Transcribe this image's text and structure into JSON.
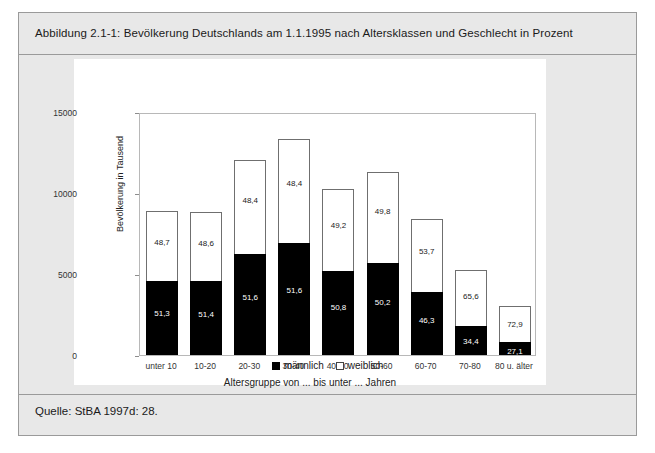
{
  "figure": {
    "caption": "Abbildung 2.1-1: Bevölkerung Deutschlands am 1.1.1995 nach Altersklassen und Geschlecht in Prozent",
    "source": "Quelle: StBA 1997d: 28."
  },
  "legend": {
    "male_label": "männlich",
    "female_label": "weiblich"
  },
  "colors": {
    "male": "#000000",
    "female": "#ffffff",
    "panel": "#ffffff",
    "figure_background": "#e8e8e8",
    "frame": "#9a9a9a"
  },
  "chart_data": {
    "type": "bar",
    "stacked": true,
    "title": "Abbildung 2.1-1: Bevölkerung Deutschlands am 1.1.1995 nach Altersklassen und Geschlecht in Prozent",
    "xlabel": "Altersgruppe von ... bis unter ... Jahren",
    "ylabel": "Bevölkerung in Tausend",
    "ylim": [
      0,
      15000
    ],
    "yticks": [
      0,
      5000,
      10000,
      15000
    ],
    "ytick_labels": [
      "0",
      "5000",
      "10000",
      "15000"
    ],
    "grid": false,
    "legend_position": "bottom",
    "categories": [
      "unter 10",
      "10-20",
      "20-30",
      "30-40",
      "40-50",
      "50-60",
      "60-70",
      "70-80",
      "80 u. älter"
    ],
    "series": [
      {
        "name": "männlich",
        "color": "#000000",
        "values": [
          4566,
          4549,
          6218,
          6889,
          5207,
          5673,
          3889,
          1806,
          827
        ],
        "data_labels": [
          "51,3",
          "51,4",
          "51,6",
          "51,6",
          "50,8",
          "50,2",
          "46,3",
          "34,4",
          "27,1"
        ]
      },
      {
        "name": "weiblich",
        "color": "#ffffff",
        "values": [
          4334,
          4301,
          5832,
          6461,
          5043,
          5627,
          4511,
          3444,
          2223
        ],
        "data_labels": [
          "48,7",
          "48,6",
          "48,4",
          "48,4",
          "49,2",
          "49,8",
          "53,7",
          "65,6",
          "72,9"
        ]
      }
    ],
    "totals": [
      8900,
      8850,
      12050,
      13350,
      10250,
      11300,
      8400,
      5250,
      3050
    ]
  }
}
